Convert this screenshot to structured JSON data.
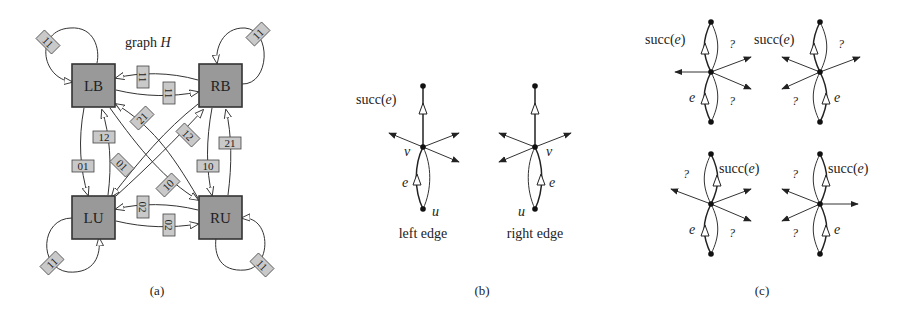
{
  "panel_a": {
    "title": "graph",
    "title_var": "H",
    "caption": "(a)",
    "nodes": [
      {
        "id": "LB",
        "label": "LB"
      },
      {
        "id": "RB",
        "label": "RB"
      },
      {
        "id": "LU",
        "label": "LU"
      },
      {
        "id": "RU",
        "label": "RU"
      }
    ],
    "edges": [
      {
        "from": "LB",
        "to": "LB",
        "label": "11"
      },
      {
        "from": "RB",
        "to": "RB",
        "label": "11"
      },
      {
        "from": "LU",
        "to": "LU",
        "label": "11"
      },
      {
        "from": "RU",
        "to": "RU",
        "label": "11"
      },
      {
        "from": "RB",
        "to": "LB",
        "label": "11"
      },
      {
        "from": "LB",
        "to": "RB",
        "label": "11"
      },
      {
        "from": "RU",
        "to": "LU",
        "label": "02"
      },
      {
        "from": "LU",
        "to": "RU",
        "label": "02"
      },
      {
        "from": "LB",
        "to": "LU",
        "label": "01"
      },
      {
        "from": "LU",
        "to": "LB",
        "label": "12"
      },
      {
        "from": "RB",
        "to": "RU",
        "label": "10"
      },
      {
        "from": "RU",
        "to": "RB",
        "label": "21"
      },
      {
        "from": "RU",
        "to": "LB",
        "label": "21"
      },
      {
        "from": "LU",
        "to": "RB",
        "label": "12"
      },
      {
        "from": "RB",
        "to": "LU",
        "label": "01"
      },
      {
        "from": "LB",
        "to": "RU",
        "label": "10"
      }
    ]
  },
  "panel_b": {
    "caption": "(b)",
    "diagrams": [
      {
        "name": "left edge",
        "succ_label": "succ(",
        "succ_var": "e",
        "succ_close": ")",
        "v": "v",
        "u": "u",
        "e": "e"
      },
      {
        "name": "right edge",
        "succ_label": "",
        "succ_var": "",
        "succ_close": "",
        "v": "v",
        "u": "u",
        "e": "e"
      }
    ]
  },
  "panel_c": {
    "caption": "(c)",
    "succ_label": "succ(",
    "succ_var": "e",
    "succ_close": ")",
    "e": "e",
    "question": "?"
  }
}
